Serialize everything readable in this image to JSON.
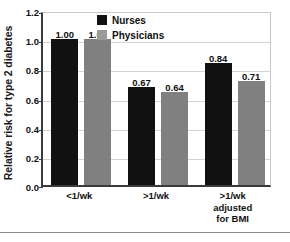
{
  "chart_data": {
    "type": "bar",
    "title": "",
    "xlabel": "",
    "ylabel": "Relative risk for type 2 diabetes",
    "ylim": [
      0.0,
      1.2
    ],
    "ytick_labels": [
      "0.0",
      "0.2",
      "0.4",
      "0.6",
      "0.8",
      "1.0",
      "1.2"
    ],
    "ytick_values": [
      0.0,
      0.2,
      0.4,
      0.6,
      0.8,
      1.0,
      1.2
    ],
    "grid": true,
    "legend_position": "top-center",
    "categories": [
      "<1/wk",
      ">1/wk",
      ">1/wk adjusted for BMI"
    ],
    "category_lines": [
      [
        "<1/wk"
      ],
      [
        ">1/wk"
      ],
      [
        ">1/wk",
        "adjusted",
        "for BMI"
      ]
    ],
    "series": [
      {
        "name": "Nurses",
        "color": "#111111",
        "values": [
          1.0,
          0.67,
          0.84
        ],
        "labels": [
          "1.00",
          "0.67",
          "0.84"
        ]
      },
      {
        "name": "Physicians",
        "color": "#808080",
        "values": [
          1.0,
          0.64,
          0.71
        ],
        "labels": [
          "1.00",
          "0.64",
          "0.71"
        ]
      }
    ]
  },
  "legend": {
    "items": [
      {
        "label": "Nurses",
        "swatch": "#111111"
      },
      {
        "label": "Physicians",
        "swatch": "#9a9a9a"
      }
    ]
  },
  "axis": {
    "y_title": "Relative risk for type 2 diabetes",
    "ticks": [
      "1.2",
      "1.0",
      "0.8",
      "0.6",
      "0.4",
      "0.2",
      "0.0"
    ]
  }
}
